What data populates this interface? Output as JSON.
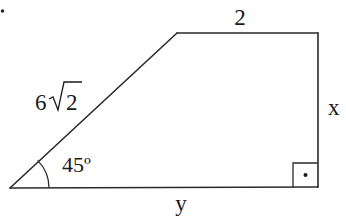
{
  "figure": {
    "type": "right trapezoid",
    "stroke_color": "#2a2a2a",
    "background": "#ffffff",
    "vertices": {
      "bottom_left": [
        10,
        188
      ],
      "top_left": [
        177,
        33
      ],
      "top_right": [
        318,
        33
      ],
      "bottom_right": [
        318,
        187
      ]
    },
    "labels": {
      "slanted_side": "6",
      "slanted_side_radicand": "2",
      "top_side": "2",
      "right_side": "x",
      "bottom_side": "y",
      "angle": "45º"
    },
    "angle_marker": {
      "vertex": "bottom_left",
      "degrees": 45
    },
    "right_angle_marker": {
      "vertex": "bottom_right",
      "has_dot": true
    }
  },
  "stray_mark": "·"
}
